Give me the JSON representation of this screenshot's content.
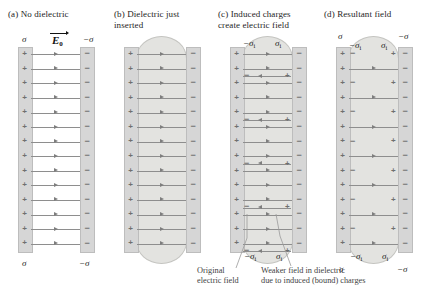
{
  "figure": {
    "panels": [
      {
        "id": "a",
        "label": "(a) No dielectric",
        "top_left_sigma": "σ",
        "top_right_sigma": "−σ",
        "bottom_left_sigma": "σ",
        "bottom_right_sigma": "−σ",
        "field_label": "E",
        "field_sub": "0",
        "field_line_count": 14,
        "has_dielectric": false,
        "plate_left_charge": "+",
        "plate_right_charge": "−"
      },
      {
        "id": "b",
        "label": "(b) Dielectric just\ninserted",
        "field_line_count": 14,
        "has_dielectric": true,
        "dielectric_shape": "rounded-slab",
        "plate_left_charge": "+",
        "plate_right_charge": "−"
      },
      {
        "id": "c",
        "label": "(c) Induced charges\ncreate electric field",
        "induced_left_sigma": "−σ",
        "induced_left_sub": "i",
        "induced_right_sigma": "σ",
        "induced_right_sub": "i",
        "bottom_induced_left_sigma": "−σ",
        "bottom_induced_left_sub": "i",
        "bottom_induced_right_sigma": "σ",
        "bottom_induced_right_sub": "i",
        "field_line_count": 14,
        "induced_line_count": 4,
        "has_dielectric": true,
        "plate_left_charge": "+",
        "plate_right_charge": "−"
      },
      {
        "id": "d",
        "label": "(d) Resultant field",
        "top_left_sigma": "σ",
        "top_right_sigma": "−σ",
        "bottom_left_sigma": "σ",
        "bottom_right_sigma": "−σ",
        "induced_left_sigma": "−σ",
        "induced_left_sub": "i",
        "induced_right_sigma": "σ",
        "induced_right_sub": "i",
        "bottom_induced_left_sigma": "−σ",
        "bottom_induced_left_sub": "i",
        "bottom_induced_right_sigma": "σ",
        "bottom_induced_right_sub": "i",
        "field_line_count": 7,
        "has_dielectric": true,
        "plate_left_charge": "+",
        "plate_right_charge": "−"
      }
    ],
    "callouts": [
      {
        "id": "original",
        "text": "Original\nelectric field"
      },
      {
        "id": "weaker",
        "text": "Weaker field in dielectric\ndue to induced (bound) charges"
      }
    ],
    "colors": {
      "plate": "#d6d6d6",
      "dielectric": "#e3e3e0",
      "field_line": "#8e8e8e",
      "charge": "#6f6f6f",
      "callout_text": "#3f3f3f",
      "title_text": "#1d1d1d"
    }
  }
}
